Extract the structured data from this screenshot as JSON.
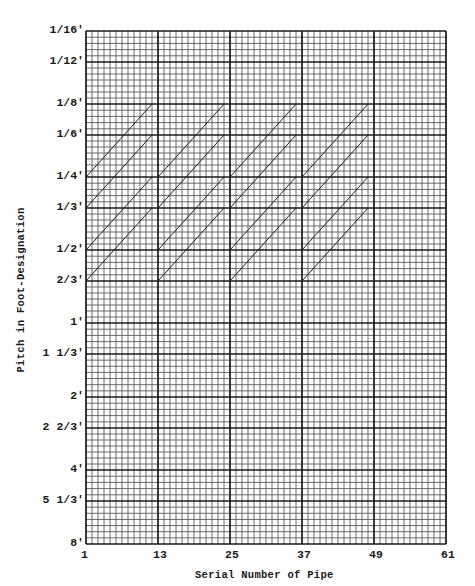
{
  "chart_data": {
    "type": "line",
    "title": "",
    "xlabel": "Serial Number of Pipe",
    "ylabel": "Pitch in Foot-Designation",
    "x_ticks": [
      "1",
      "13",
      "25",
      "37",
      "49",
      "61"
    ],
    "y_ticks": [
      "1/16'",
      "1/12'",
      "1/8'",
      "1/6'",
      "1/4'",
      "1/3'",
      "1/2'",
      "2/3'",
      "1'",
      "1 1/3'",
      "2'",
      "2 2/3'",
      "4'",
      "5 1/3'",
      "8'"
    ],
    "y_scale": "log2 (pitch, shorter/higher at top)",
    "xlim": [
      1,
      61
    ],
    "ylim": [
      "8'",
      "1/16'"
    ],
    "grid": true,
    "legend": null,
    "series": [
      {
        "name": "group-1 line a",
        "x": [
          1,
          12
        ],
        "y": [
          "1/4'",
          "1/8'"
        ]
      },
      {
        "name": "group-1 line b",
        "x": [
          1,
          12
        ],
        "y": [
          "1/3'",
          "1/6'"
        ]
      },
      {
        "name": "group-1 line c",
        "x": [
          1,
          12
        ],
        "y": [
          "1/2'",
          "1/4'"
        ]
      },
      {
        "name": "group-1 line d",
        "x": [
          1,
          12
        ],
        "y": [
          "2/3'",
          "1/3'"
        ]
      },
      {
        "name": "group-2 line a",
        "x": [
          13,
          24
        ],
        "y": [
          "1/4'",
          "1/8'"
        ]
      },
      {
        "name": "group-2 line b",
        "x": [
          13,
          24
        ],
        "y": [
          "1/3'",
          "1/6'"
        ]
      },
      {
        "name": "group-2 line c",
        "x": [
          13,
          24
        ],
        "y": [
          "1/2'",
          "1/4'"
        ]
      },
      {
        "name": "group-2 line d",
        "x": [
          13,
          24
        ],
        "y": [
          "2/3'",
          "1/3'"
        ]
      },
      {
        "name": "group-3 line a",
        "x": [
          25,
          36
        ],
        "y": [
          "1/4'",
          "1/8'"
        ]
      },
      {
        "name": "group-3 line b",
        "x": [
          25,
          36
        ],
        "y": [
          "1/3'",
          "1/6'"
        ]
      },
      {
        "name": "group-3 line c",
        "x": [
          25,
          36
        ],
        "y": [
          "1/2'",
          "1/4'"
        ]
      },
      {
        "name": "group-3 line d",
        "x": [
          25,
          36
        ],
        "y": [
          "2/3'",
          "1/3'"
        ]
      },
      {
        "name": "group-4 line a",
        "x": [
          37,
          48
        ],
        "y": [
          "1/4'",
          "1/8'"
        ]
      },
      {
        "name": "group-4 line b",
        "x": [
          37,
          48
        ],
        "y": [
          "1/3'",
          "1/6'"
        ]
      },
      {
        "name": "group-4 line c",
        "x": [
          37,
          48
        ],
        "y": [
          "1/2'",
          "1/4'"
        ]
      },
      {
        "name": "group-4 line d",
        "x": [
          37,
          48
        ],
        "y": [
          "2/3'",
          "1/3'"
        ]
      }
    ]
  },
  "axes": {
    "x_title": "Serial Number of Pipe",
    "y_title": "Pitch in Foot-Designation",
    "x_ticks": [
      {
        "label": "1",
        "px": 86
      },
      {
        "label": "13",
        "px": 158
      },
      {
        "label": "25",
        "px": 230
      },
      {
        "label": "37",
        "px": 302
      },
      {
        "label": "49",
        "px": 374
      },
      {
        "label": "61",
        "px": 446
      }
    ],
    "y_ticks": [
      {
        "label": "1/16'",
        "py": 31
      },
      {
        "label": "1/12'",
        "py": 62
      },
      {
        "label": "1/8'",
        "py": 104
      },
      {
        "label": "1/6'",
        "py": 135
      },
      {
        "label": "1/4'",
        "py": 177
      },
      {
        "label": "1/3'",
        "py": 208
      },
      {
        "label": "1/2'",
        "py": 250
      },
      {
        "label": "2/3'",
        "py": 281
      },
      {
        "label": "1'",
        "py": 323
      },
      {
        "label": "1 1/3'",
        "py": 354
      },
      {
        "label": "2'",
        "py": 397
      },
      {
        "label": "2 2/3'",
        "py": 428
      },
      {
        "label": "4'",
        "py": 470
      },
      {
        "label": "5 1/3'",
        "py": 501
      },
      {
        "label": "8'",
        "py": 544
      }
    ]
  },
  "colors": {
    "grid_minor": "#5a5a5a",
    "grid_major": "#1a1a1a",
    "lines": "#222222",
    "text": "#1a1a1a"
  }
}
